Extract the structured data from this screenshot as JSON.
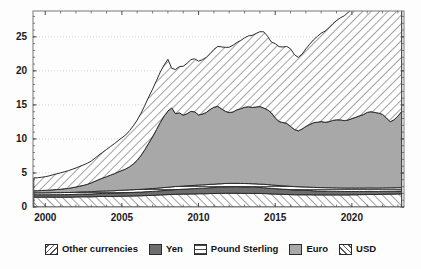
{
  "chart_data": {
    "type": "area",
    "stacked": true,
    "title": "",
    "xlabel": "",
    "ylabel": "",
    "xlim": [
      1999.2,
      2023.4
    ],
    "ylim": [
      0,
      28.8
    ],
    "xticks": [
      2000,
      2005,
      2010,
      2015,
      2020
    ],
    "xtick_labels": [
      "2000",
      "2005",
      "2010",
      "2015",
      "2020"
    ],
    "yticks": [
      0,
      5,
      10,
      15,
      20,
      25
    ],
    "ytick_labels": [
      "0",
      "5",
      "10",
      "15",
      "20",
      "25"
    ],
    "grid": "horizontal-dotted",
    "legend_position": "bottom-center",
    "x": [
      1999.25,
      1999.5,
      1999.75,
      2000.0,
      2000.25,
      2000.5,
      2000.75,
      2001.0,
      2001.25,
      2001.5,
      2001.75,
      2002.0,
      2002.25,
      2002.5,
      2002.75,
      2003.0,
      2003.25,
      2003.5,
      2003.75,
      2004.0,
      2004.25,
      2004.5,
      2004.75,
      2005.0,
      2005.25,
      2005.5,
      2005.75,
      2006.0,
      2006.25,
      2006.5,
      2006.75,
      2007.0,
      2007.25,
      2007.5,
      2007.75,
      2008.0,
      2008.25,
      2008.5,
      2008.75,
      2009.0,
      2009.25,
      2009.5,
      2009.75,
      2010.0,
      2010.25,
      2010.5,
      2010.75,
      2011.0,
      2011.25,
      2011.5,
      2011.75,
      2012.0,
      2012.25,
      2012.5,
      2012.75,
      2013.0,
      2013.25,
      2013.5,
      2013.75,
      2014.0,
      2014.25,
      2014.5,
      2014.75,
      2015.0,
      2015.25,
      2015.5,
      2015.75,
      2016.0,
      2016.25,
      2016.5,
      2016.75,
      2017.0,
      2017.25,
      2017.5,
      2017.75,
      2018.0,
      2018.25,
      2018.5,
      2018.75,
      2019.0,
      2019.25,
      2019.5,
      2019.75,
      2020.0,
      2020.25,
      2020.5,
      2020.75,
      2021.0,
      2021.25,
      2021.5,
      2021.75,
      2022.0,
      2022.25,
      2022.5,
      2022.75,
      2023.0,
      2023.25
    ],
    "series": [
      {
        "name": "Other currencies",
        "pattern": "diagonal-backslash-hatch",
        "values": [
          1.45,
          1.45,
          1.45,
          1.45,
          1.45,
          1.45,
          1.45,
          1.45,
          1.45,
          1.45,
          1.45,
          1.48,
          1.5,
          1.5,
          1.5,
          1.5,
          1.52,
          1.55,
          1.55,
          1.55,
          1.55,
          1.55,
          1.58,
          1.6,
          1.6,
          1.62,
          1.62,
          1.65,
          1.65,
          1.68,
          1.7,
          1.72,
          1.75,
          1.78,
          1.8,
          1.82,
          1.85,
          1.88,
          1.88,
          1.9,
          1.9,
          1.92,
          1.92,
          1.95,
          1.95,
          1.95,
          1.98,
          1.98,
          2.0,
          2.0,
          2.02,
          2.02,
          2.02,
          2.02,
          2.0,
          2.0,
          2.0,
          2.0,
          2.0,
          1.98,
          1.98,
          1.95,
          1.92,
          1.9,
          1.88,
          1.85,
          1.85,
          1.82,
          1.8,
          1.8,
          1.8,
          1.8,
          1.8,
          1.78,
          1.78,
          1.78,
          1.78,
          1.78,
          1.78,
          1.78,
          1.78,
          1.78,
          1.78,
          1.8,
          1.8,
          1.82,
          1.82,
          1.85,
          1.85,
          1.85,
          1.85,
          1.88,
          1.88,
          1.9,
          1.9,
          1.92,
          1.92
        ]
      },
      {
        "name": "Yen",
        "pattern": "solid-dark-gray",
        "values": [
          0.35,
          0.35,
          0.35,
          0.35,
          0.35,
          0.36,
          0.36,
          0.36,
          0.37,
          0.37,
          0.38,
          0.38,
          0.39,
          0.4,
          0.4,
          0.41,
          0.42,
          0.43,
          0.44,
          0.45,
          0.46,
          0.47,
          0.48,
          0.49,
          0.5,
          0.51,
          0.52,
          0.53,
          0.54,
          0.55,
          0.56,
          0.57,
          0.58,
          0.6,
          0.62,
          0.64,
          0.66,
          0.68,
          0.7,
          0.72,
          0.74,
          0.76,
          0.78,
          0.8,
          0.82,
          0.84,
          0.86,
          0.88,
          0.9,
          0.92,
          0.94,
          0.95,
          0.95,
          0.96,
          0.96,
          0.95,
          0.94,
          0.92,
          0.9,
          0.88,
          0.86,
          0.84,
          0.82,
          0.8,
          0.78,
          0.76,
          0.74,
          0.72,
          0.7,
          0.68,
          0.66,
          0.64,
          0.62,
          0.6,
          0.58,
          0.57,
          0.56,
          0.55,
          0.54,
          0.53,
          0.52,
          0.51,
          0.5,
          0.49,
          0.48,
          0.47,
          0.46,
          0.45,
          0.45,
          0.44,
          0.44,
          0.43,
          0.43,
          0.42,
          0.42,
          0.42,
          0.42
        ]
      },
      {
        "name": "Pound Sterling",
        "pattern": "horizontal-lines-white",
        "values": [
          0.28,
          0.28,
          0.28,
          0.29,
          0.29,
          0.3,
          0.3,
          0.3,
          0.31,
          0.31,
          0.32,
          0.32,
          0.33,
          0.33,
          0.34,
          0.34,
          0.35,
          0.35,
          0.36,
          0.36,
          0.37,
          0.37,
          0.38,
          0.38,
          0.39,
          0.39,
          0.4,
          0.4,
          0.41,
          0.41,
          0.42,
          0.42,
          0.43,
          0.43,
          0.44,
          0.44,
          0.45,
          0.45,
          0.46,
          0.46,
          0.47,
          0.47,
          0.48,
          0.48,
          0.48,
          0.49,
          0.49,
          0.49,
          0.5,
          0.5,
          0.5,
          0.5,
          0.5,
          0.5,
          0.5,
          0.5,
          0.5,
          0.5,
          0.5,
          0.5,
          0.5,
          0.5,
          0.5,
          0.5,
          0.5,
          0.5,
          0.5,
          0.5,
          0.5,
          0.5,
          0.5,
          0.5,
          0.5,
          0.5,
          0.5,
          0.5,
          0.5,
          0.5,
          0.5,
          0.5,
          0.5,
          0.5,
          0.5,
          0.5,
          0.5,
          0.5,
          0.5,
          0.5,
          0.5,
          0.5,
          0.5,
          0.5,
          0.5,
          0.5,
          0.5,
          0.5,
          0.5
        ]
      },
      {
        "name": "Euro",
        "pattern": "solid-medium-gray",
        "values": [
          0.3,
          0.32,
          0.34,
          0.36,
          0.38,
          0.42,
          0.46,
          0.5,
          0.55,
          0.6,
          0.68,
          0.75,
          0.85,
          0.95,
          1.1,
          1.3,
          1.5,
          1.7,
          1.9,
          2.1,
          2.3,
          2.5,
          2.7,
          2.9,
          3.1,
          3.4,
          3.8,
          4.3,
          5.0,
          5.8,
          6.7,
          7.6,
          8.6,
          9.6,
          10.5,
          11.2,
          11.6,
          10.7,
          10.8,
          10.4,
          10.6,
          10.9,
          10.8,
          10.3,
          10.4,
          10.6,
          11.0,
          11.3,
          11.4,
          11.0,
          10.6,
          10.4,
          10.5,
          10.8,
          11.0,
          11.2,
          11.3,
          11.2,
          11.3,
          11.4,
          11.2,
          11.0,
          10.6,
          9.9,
          9.4,
          9.3,
          9.2,
          8.8,
          8.4,
          8.2,
          8.5,
          8.9,
          9.2,
          9.5,
          9.6,
          9.7,
          9.6,
          9.7,
          9.9,
          10.0,
          10.0,
          9.9,
          10.0,
          10.2,
          10.4,
          10.6,
          10.8,
          11.1,
          11.2,
          11.1,
          11.0,
          10.8,
          10.3,
          9.7,
          10.0,
          10.5,
          11.2
        ]
      },
      {
        "name": "USD",
        "pattern": "diagonal-forwardslash-hatch",
        "values": [
          1.9,
          1.9,
          1.95,
          2.0,
          2.1,
          2.2,
          2.3,
          2.4,
          2.5,
          2.6,
          2.7,
          2.8,
          2.9,
          3.0,
          3.1,
          3.2,
          3.4,
          3.6,
          3.8,
          4.0,
          4.2,
          4.4,
          4.6,
          4.8,
          5.0,
          5.3,
          5.6,
          5.9,
          6.2,
          6.5,
          6.8,
          7.0,
          7.2,
          7.4,
          7.5,
          7.6,
          5.8,
          6.5,
          6.8,
          7.2,
          7.4,
          7.6,
          7.8,
          7.9,
          8.0,
          8.1,
          8.2,
          8.5,
          8.8,
          9.1,
          9.4,
          9.6,
          9.8,
          9.9,
          10.0,
          10.2,
          10.4,
          10.6,
          10.8,
          11.0,
          11.2,
          10.8,
          10.4,
          10.9,
          11.0,
          11.1,
          11.3,
          11.4,
          11.0,
          10.8,
          11.0,
          11.4,
          11.8,
          12.2,
          12.6,
          13.0,
          13.4,
          13.8,
          14.2,
          14.6,
          15.0,
          15.4,
          15.8,
          16.1,
          16.4,
          16.8,
          17.2,
          17.4,
          17.8,
          18.2,
          18.8,
          19.6,
          20.4,
          20.2,
          19.8,
          20.5,
          21.3
        ]
      }
    ],
    "totals_note": "stacked total peaks near 28.3 at the right edge"
  },
  "legend": {
    "items": [
      {
        "label": "Other currencies",
        "swatch": "hatch-backslash-swatch"
      },
      {
        "label": "Yen",
        "swatch": "solid-dark-swatch"
      },
      {
        "label": "Pound Sterling",
        "swatch": "horizontal-lines-swatch"
      },
      {
        "label": "Euro",
        "swatch": "solid-gray-swatch"
      },
      {
        "label": "USD",
        "swatch": "hatch-forwardslash-swatch"
      }
    ]
  },
  "colors": {
    "other": "#ffffff",
    "yen": "#6e6e6e",
    "pound": "#ffffff",
    "euro": "#a8a8a8",
    "usd": "#ffffff",
    "line": "#2b2b2b",
    "grid": "#c9c9c9",
    "axis": "#4a4a4a",
    "background": "#fdfdfd"
  }
}
